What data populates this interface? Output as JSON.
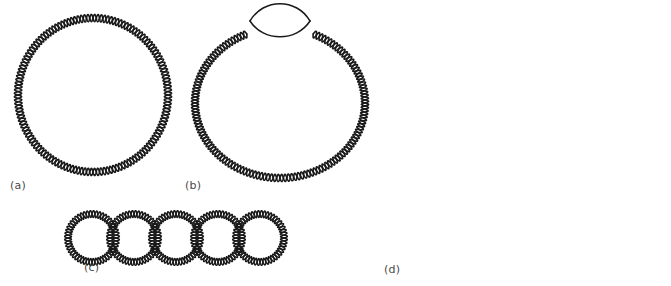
{
  "figure": {
    "background_color": "#ffffff",
    "ink_color": "#1a1a1a",
    "label_color": "#4a4a4a",
    "width": 671,
    "height": 286
  },
  "panels": [
    {
      "id": "a",
      "label": "(a)",
      "kind": "diagram",
      "content_name": "closed-circular-duplex-dna",
      "description": "Relaxed closed circular double-stranded DNA drawn as a continuous double helix ring",
      "helix_turns": 72,
      "geometry": {
        "cx": 93,
        "cy": 95,
        "rx": 75,
        "ry": 77
      }
    },
    {
      "id": "b",
      "label": "(b)",
      "kind": "diagram",
      "content_name": "circular-dna-with-denaturation-bubble",
      "description": "Circular double-stranded DNA containing a single-stranded bubble (denaturation / replication bubble) at the top",
      "helix_turns": 68,
      "geometry": {
        "cx": 95,
        "cy": 103,
        "rx": 85,
        "ry": 75
      },
      "bubble": {
        "cx": 95,
        "cy": 21,
        "rx": 30,
        "ry": 14,
        "gap_degrees": 46
      }
    },
    {
      "id": "c",
      "label": "(c)",
      "kind": "diagram",
      "content_name": "catenated-circular-dna",
      "description": "Catenane: five interlocked circular double-stranded DNA molecules forming a chain",
      "ring_count": 5,
      "ring_radius": 24,
      "ring_spacing": 42,
      "helix_turns_per_ring": 26
    },
    {
      "id": "d",
      "label": "(d)",
      "kind": "electron-micrograph",
      "content_name": "dna-electron-micrograph",
      "description": "Electron micrograph showing relaxed open circular and supercoiled DNA molecules on a grainy stained background",
      "background_tone": "#c8c8c8",
      "strand_tone": "#4e4e4e",
      "grain_density": 0.34,
      "molecules": [
        {
          "name": "relaxed-open-circle",
          "type": "relaxed",
          "position": "upper-left"
        },
        {
          "name": "supercoiled-molecule-top",
          "type": "supercoiled",
          "position": "top-center"
        },
        {
          "name": "supercoiled-molecule-center",
          "type": "supercoiled",
          "position": "center"
        },
        {
          "name": "supercoiled-molecule-right",
          "type": "supercoiled",
          "position": "right"
        },
        {
          "name": "supercoiled-molecule-bottom",
          "type": "supercoiled",
          "position": "bottom-center"
        },
        {
          "name": "partial-molecule-top-right",
          "type": "supercoiled",
          "position": "top-right-edge"
        }
      ]
    }
  ]
}
